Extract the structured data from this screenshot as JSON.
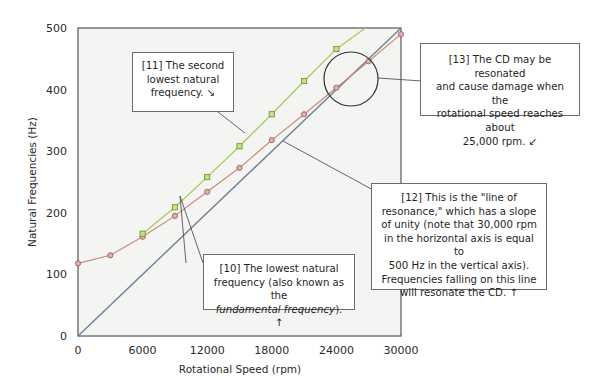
{
  "chart_data": {
    "type": "line",
    "title": "",
    "xlabel": "Rotational Speed (rpm)",
    "ylabel": "Natural Frequencies (Hz)",
    "xlim": [
      0,
      30000
    ],
    "ylim": [
      0,
      500
    ],
    "x_ticks": [
      "0",
      "6000",
      "12000",
      "18000",
      "24000",
      "30000"
    ],
    "y_ticks": [
      "0",
      "100",
      "200",
      "300",
      "400",
      "500"
    ],
    "grid": false,
    "legend": null,
    "series": [
      {
        "name": "Lowest natural frequency (fundamental)",
        "color": "#c98a7a",
        "marker": "circle",
        "x": [
          0,
          3000,
          6000,
          9000,
          12000,
          15000,
          18000,
          21000,
          24000,
          27000,
          30000
        ],
        "values": [
          118,
          131,
          161,
          195,
          234,
          273,
          318,
          360,
          403,
          446,
          490
        ]
      },
      {
        "name": "Second lowest natural frequency",
        "color": "#a6c95a",
        "marker": "square",
        "x": [
          6000,
          9000,
          12000,
          15000,
          18000,
          21000,
          24000
        ],
        "values": [
          166,
          209,
          258,
          308,
          360,
          414,
          466
        ],
        "extends_to": [
          26700,
          500
        ]
      },
      {
        "name": "Line of resonance (slope of unity)",
        "color": "#6f7f95",
        "marker": "none",
        "x": [
          0,
          30000
        ],
        "values": [
          0,
          500
        ]
      }
    ],
    "annotations": [
      {
        "id": "11",
        "text": "[11] The second lowest natural frequency. ↘"
      },
      {
        "id": "10",
        "text": "[10] The lowest natural frequency (also known as the fundamental frequency). ↑"
      },
      {
        "id": "12",
        "text": "[12] This is the \"line of resonance,\" which has a slope of unity (note that 30,000 rpm in the horizontal axis is equal to 500 Hz in the vertical axis). Frequencies falling on this line will resonate the CD. ↑"
      },
      {
        "id": "13",
        "text": "[13] The CD may be resonated and cause damage when the rotational speed reaches about 25,000 rpm. ↙"
      }
    ],
    "highlight_circle": {
      "center_rpm": 25500,
      "center_hz": 416,
      "label": "resonance region"
    }
  },
  "callouts": {
    "c11": {
      "l1": "[11] The second",
      "l2": "lowest natural",
      "l3": "frequency.  ↘"
    },
    "c10": {
      "l1": "[10] The lowest natural",
      "l2": "frequency (also known as the",
      "l3_italic": "fundamental frequency",
      "l3_tail": ").  ↑"
    },
    "c12": {
      "l1": "[12] This is the \"line of",
      "l2": "resonance,\" which has a slope",
      "l3": "of unity (note that 30,000 rpm",
      "l4": "in the horizontal axis is equal to",
      "l5": "500 Hz in the vertical axis).",
      "l6": "Frequencies falling on this line",
      "l7": "will resonate the CD. ↑"
    },
    "c13": {
      "l1": "[13] The CD may be resonated",
      "l2": "and cause damage when the",
      "l3": "rotational speed reaches about",
      "l4": "25,000 rpm.  ↙"
    }
  }
}
